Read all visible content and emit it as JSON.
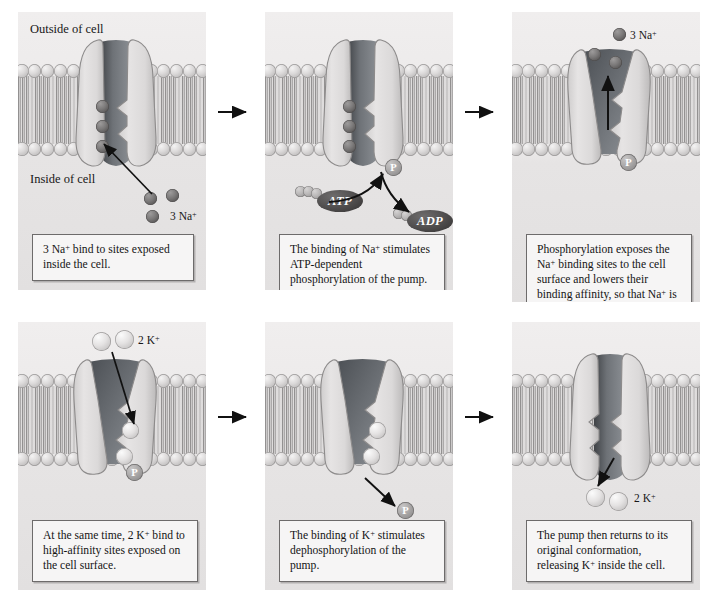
{
  "figure": {
    "background_color": "#ffffff",
    "panel_background": "#eceaea"
  },
  "legend_labels": {
    "outside": "Outside of cell",
    "inside": "Inside of cell"
  },
  "colors": {
    "sodium_ion": "#6b6969",
    "potassium_ion": "#dedcdc",
    "phosphate": "#a09e9e",
    "nucleotide": "#4a4848",
    "membrane_head": "#d4d2d2",
    "protein_body": "#dcdada",
    "protein_channel": "#55595e"
  },
  "panels": [
    {
      "id": "panel-1",
      "step": 1,
      "caption": "3 Na+ bind to sites exposed inside the cell.",
      "caption_parts": [
        "3 Na",
        "+",
        " bind to sites exposed inside the cell."
      ],
      "ion_label": "3 Na+",
      "ion_label_text": "3 Na",
      "ion_label_sup": "+",
      "ion_species": "sodium",
      "ion_count": 3,
      "bound_ions": 3,
      "free_ions": 3,
      "phosphorylated": false,
      "conformation": "inward-open",
      "show_outside_label": true,
      "show_inside_label": true,
      "arrow_direction": "inward-binding"
    },
    {
      "id": "panel-2",
      "step": 2,
      "caption": "The binding of Na+ stimulates ATP-dependent phosphorylation of the pump.",
      "caption_parts": [
        "The binding of Na",
        "+",
        " stimulates ATP-dependent phosphorylation of the pump."
      ],
      "ion_species": "sodium",
      "bound_ions": 3,
      "free_ions": 0,
      "phosphorylated": true,
      "conformation": "inward-open",
      "atp_label": "ATP",
      "adp_label": "ADP",
      "phosphate_label": "P",
      "atp_phosphate_count": 3,
      "adp_phosphate_count": 2,
      "show_outside_label": false,
      "show_inside_label": false
    },
    {
      "id": "panel-3",
      "step": 3,
      "caption": "Phosphorylation exposes the Na+ binding sites to the cell surface and lowers their binding affinity, so that Na+ is released outside the cell.",
      "caption_parts": [
        "Phosphorylation exposes the Na",
        "+",
        " binding sites to the cell surface and lowers their binding affinity, so that Na",
        "+",
        " is released outside the cell."
      ],
      "ion_label_text": "3 Na",
      "ion_label_sup": "+",
      "ion_species": "sodium",
      "ion_count": 3,
      "bound_ions": 0,
      "free_ions": 3,
      "phosphorylated": true,
      "phosphate_label": "P",
      "conformation": "outward-open",
      "arrow_direction": "outward-release",
      "show_outside_label": false,
      "show_inside_label": false
    },
    {
      "id": "panel-4",
      "step": 4,
      "caption": "At the same time, 2 K+ bind to high-affinity sites exposed on the cell surface.",
      "caption_parts": [
        "At the same time, 2 K",
        "+",
        " bind to high-affinity sites exposed on the cell surface."
      ],
      "ion_label_text": "2 K",
      "ion_label_sup": "+",
      "ion_species": "potassium",
      "ion_count": 2,
      "bound_ions": 2,
      "free_ions": 2,
      "phosphorylated": true,
      "phosphate_label": "P",
      "conformation": "outward-open",
      "arrow_direction": "inward-binding",
      "show_outside_label": false,
      "show_inside_label": false
    },
    {
      "id": "panel-5",
      "step": 5,
      "caption": "The binding of K+ stimulates dephosphorylation of the pump.",
      "caption_parts": [
        "The binding of K",
        "+",
        " stimulates dephosphorylation of the pump."
      ],
      "ion_species": "potassium",
      "bound_ions": 2,
      "free_ions": 0,
      "phosphorylated": false,
      "phosphate_label": "P",
      "phosphate_released": true,
      "conformation": "outward-open",
      "show_outside_label": false,
      "show_inside_label": false
    },
    {
      "id": "panel-6",
      "step": 6,
      "caption": "The pump then returns to its original conformation, releasing K+ inside the cell.",
      "caption_parts": [
        "The pump then returns to its original conformation, releasing K",
        "+",
        " inside the cell."
      ],
      "ion_label_text": "2 K",
      "ion_label_sup": "+",
      "ion_species": "potassium",
      "ion_count": 2,
      "bound_ions": 0,
      "free_ions": 2,
      "phosphorylated": false,
      "conformation": "inward-open",
      "arrow_direction": "inward-release",
      "show_outside_label": false,
      "show_inside_label": false
    }
  ],
  "step_arrows": [
    {
      "from": 1,
      "to": 2,
      "direction": "right"
    },
    {
      "from": 2,
      "to": 3,
      "direction": "right"
    },
    {
      "from": 4,
      "to": 5,
      "direction": "right"
    },
    {
      "from": 5,
      "to": 6,
      "direction": "right"
    }
  ]
}
